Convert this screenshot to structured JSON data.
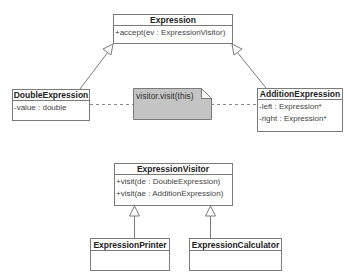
{
  "diagram": {
    "type": "uml-class-diagram",
    "classes": {
      "expression": {
        "name": "Expression",
        "members": [
          "+accept(ev : ExpressionVisitor)"
        ]
      },
      "double_expression": {
        "name": "DoubleExpression",
        "members": [
          "-value : double"
        ]
      },
      "addition_expression": {
        "name": "AdditionExpression",
        "members": [
          "-left : Expression*",
          "-right : Expression*"
        ]
      },
      "expression_visitor": {
        "name": "ExpressionVisitor",
        "members": [
          "+visit(de : DoubleExpression)",
          "+visit(ae : AdditionExpression)"
        ]
      },
      "expression_printer": {
        "name": "ExpressionPrinter",
        "members": []
      },
      "expression_calculator": {
        "name": "ExpressionCalculator",
        "members": []
      }
    },
    "note": {
      "text": "visitor.visit(this)"
    },
    "relationships": [
      {
        "type": "generalization",
        "from": "DoubleExpression",
        "to": "Expression"
      },
      {
        "type": "generalization",
        "from": "AdditionExpression",
        "to": "Expression"
      },
      {
        "type": "note-anchor",
        "from": "visitor.visit(this)",
        "to": "DoubleExpression"
      },
      {
        "type": "note-anchor",
        "from": "visitor.visit(this)",
        "to": "AdditionExpression"
      },
      {
        "type": "generalization",
        "from": "ExpressionPrinter",
        "to": "ExpressionVisitor"
      },
      {
        "type": "generalization",
        "from": "ExpressionCalculator",
        "to": "ExpressionVisitor"
      }
    ],
    "colors": {
      "line": "#7a7a7a",
      "note_fill": "#c4c4c4",
      "background": "#ffffff"
    }
  }
}
